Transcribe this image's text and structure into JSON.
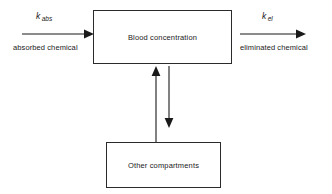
{
  "diagram": {
    "boxes": [
      {
        "id": "blood",
        "label": "Blood concentration"
      },
      {
        "id": "other",
        "label": "Other compartments"
      }
    ],
    "inflow": {
      "rate_symbol": "k",
      "rate_subscript": "abs",
      "caption": "absorbed chemical",
      "direction": "right"
    },
    "outflow": {
      "rate_symbol": "k",
      "rate_subscript": "el",
      "caption": "eliminated chemical",
      "direction": "right"
    },
    "exchange": {
      "up_arrow_name": "other-to-blood-arrow",
      "down_arrow_name": "blood-to-other-arrow"
    },
    "colors": {
      "stroke": "#1a1a1a",
      "box_border": "#2b2b2b",
      "background": "#ffffff"
    }
  }
}
